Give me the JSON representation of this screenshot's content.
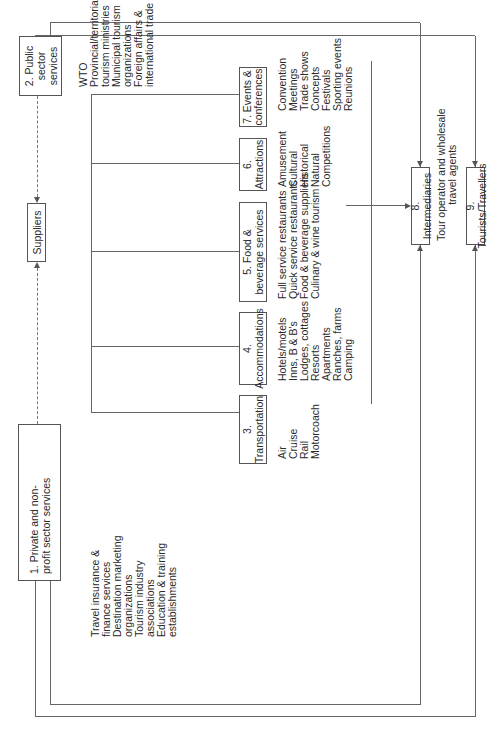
{
  "diagram": {
    "orientation": "rotated 90deg counter-clockwise",
    "nodes": {
      "private": {
        "label": "1. Private and non-profit sector services"
      },
      "public": {
        "label": "2. Public sector services"
      },
      "suppliers": {
        "label": "Suppliers"
      },
      "transportation": {
        "label": "3. Transportation"
      },
      "accommodations": {
        "label": "4. Accommodations"
      },
      "food": {
        "label": "5. Food & beverage services"
      },
      "attractions": {
        "label": "6. Attractions"
      },
      "events": {
        "label": "7. Events & conferences"
      },
      "intermediaries": {
        "label": "8. Intermediaries"
      },
      "tourists": {
        "label": "9. Tourists/Travellers"
      }
    },
    "lists": {
      "private": [
        "Travel insurance &",
        "finance services",
        "Destination marketing",
        "organizations",
        "Tourism industry",
        "associations",
        "Education & training",
        "establishments"
      ],
      "public": [
        "WTO",
        "Provincial/territorial",
        "tourism ministries",
        "Municipal tourism",
        "organizations",
        "Foreign affairs &",
        "international trade"
      ],
      "transportation": [
        "Air",
        "Cruise",
        "Rail",
        "Motorcoach"
      ],
      "accommodations": [
        "Hotels/motels",
        "Inns, B & B's",
        "Lodges, cottages",
        "Resorts",
        "Apartments",
        "Ranches, farms",
        "Camping"
      ],
      "food": [
        "Full service restaurants",
        "Quick service restaurants",
        "Food & beverage suppliers",
        "Culinary & wine tourism"
      ],
      "attractions": [
        "Amusement",
        "Cultural",
        "Historical",
        "Natural",
        "Competitions"
      ],
      "events": [
        "Convention",
        "Meetings",
        "Trade shows",
        "Concepts",
        "Festivals",
        "Sporting events",
        "Reunions"
      ],
      "intermediaries": [
        "Tour operator and wholesale",
        "travel agents"
      ]
    }
  }
}
